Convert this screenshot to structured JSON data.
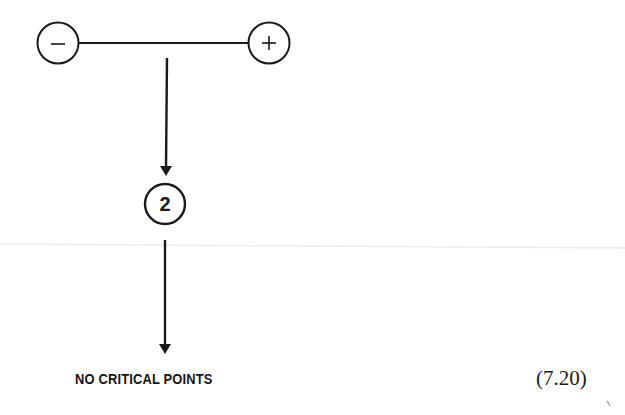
{
  "diagram": {
    "type": "phase-line-bifurcation",
    "top_row": {
      "left_node": {
        "symbol": "−",
        "meaning": "negative"
      },
      "right_node": {
        "symbol": "+",
        "meaning": "positive"
      }
    },
    "middle_node": {
      "label": "2"
    },
    "result_text": "NO CRITICAL POINTS",
    "equation_number": "(7.20)",
    "colors": {
      "ink": "#1a1a1a",
      "background": "#ffffff",
      "scan_line": "#e6e6e6"
    }
  }
}
